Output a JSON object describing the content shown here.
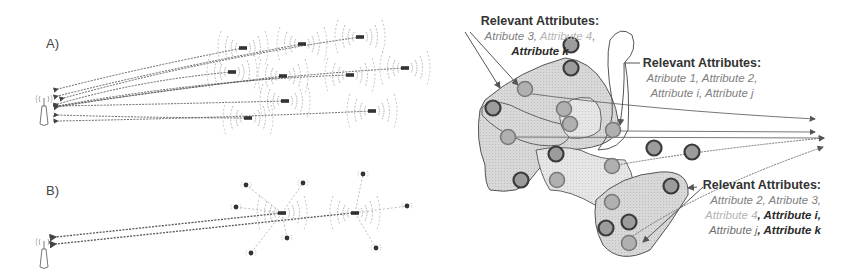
{
  "panels": {
    "A": {
      "label": "A)"
    },
    "B": {
      "label": "B)"
    }
  },
  "attribute_groups": [
    {
      "title": "Relevant Attributes:",
      "lines": [
        [
          {
            "text": "Atribute 3",
            "tone": "mid"
          },
          {
            "text": ", ",
            "tone": "mid"
          },
          {
            "text": "Attribute 4",
            "tone": "light"
          },
          {
            "text": ",",
            "tone": "mid"
          }
        ],
        [
          {
            "text": "Attribute k",
            "tone": "dark"
          }
        ]
      ]
    },
    {
      "title": "Relevant Attributes:",
      "lines": [
        [
          {
            "text": "Atribute 1, Attribute 2,",
            "tone": "mid"
          }
        ],
        [
          {
            "text": "Attribute i, Attribute j",
            "tone": "mid"
          }
        ]
      ]
    },
    {
      "title": "Relevant Attributes:",
      "lines": [
        [
          {
            "text": "Attribute 2, Atribute 3,",
            "tone": "mid"
          }
        ],
        [
          {
            "text": "Attribute 4",
            "tone": "light"
          },
          {
            "text": ", Attribute i,",
            "tone": "dark"
          }
        ],
        [
          {
            "text": "Attribute j",
            "tone": "med"
          },
          {
            "text": ", Attribute k",
            "tone": "dark"
          }
        ]
      ]
    }
  ],
  "colors": {
    "stroke": "#555555",
    "region_fill": "#d6d6d6",
    "node_fill_dark": "#8a8a8a",
    "node_fill_light": "#a8a8a8",
    "node_ring": "#3a3a3a",
    "signal": "#9a9a9a"
  }
}
